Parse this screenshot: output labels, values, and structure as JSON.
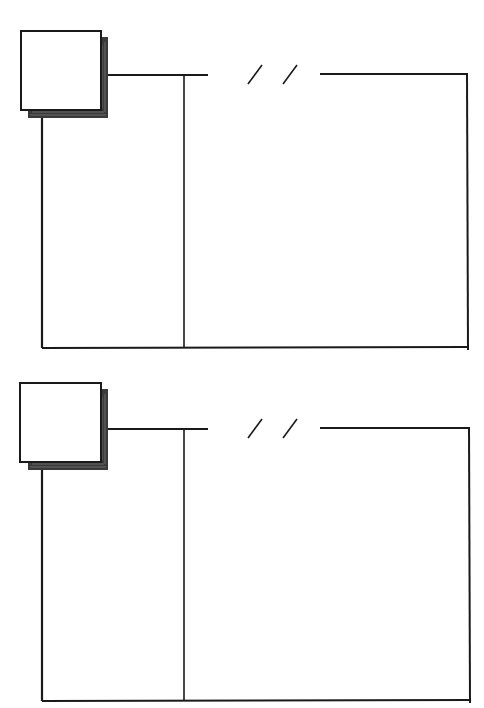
{
  "page": {
    "title": ""
  },
  "colors": {
    "ink": "#1a1a1a",
    "shadow": "#3a3a3a",
    "paper": "#ffffff"
  },
  "panels": [
    {
      "id": "top",
      "offset_y": 0,
      "corner_square": {
        "icon": "square-note-icon"
      },
      "break_mark": {
        "icon": "double-slash-icon",
        "text": "/ /"
      },
      "columns": {
        "left_label": "",
        "right_label": ""
      }
    },
    {
      "id": "bottom",
      "offset_y": 354,
      "corner_square": {
        "icon": "square-note-icon"
      },
      "break_mark": {
        "icon": "double-slash-icon",
        "text": "/ /"
      },
      "columns": {
        "left_label": "",
        "right_label": ""
      }
    }
  ]
}
